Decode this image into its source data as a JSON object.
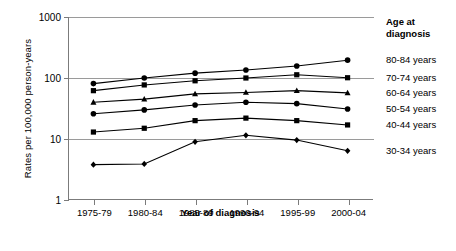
{
  "chart_data": {
    "type": "line",
    "title": "",
    "xlabel": "Year of diagnosis",
    "ylabel": "Rates per 100,000 person-years",
    "categories": [
      "1975-79",
      "1980-84",
      "1985-89",
      "1990-94",
      "1995-99",
      "2000-04"
    ],
    "yscale": "log",
    "ylim": [
      1,
      1000
    ],
    "yticks": [
      "1",
      "10",
      "100",
      "1000"
    ],
    "grid": true,
    "legend_position": "right",
    "legend_title_line1": "Age at",
    "legend_title_line2": "diagnosis",
    "series": [
      {
        "name": "80-84 years",
        "marker": "circle",
        "values": [
          81,
          100,
          120,
          135,
          157,
          196
        ]
      },
      {
        "name": "70-74 years",
        "marker": "square",
        "values": [
          62,
          77,
          90,
          100,
          113,
          101
        ]
      },
      {
        "name": "60-64 years",
        "marker": "triangle",
        "values": [
          40,
          45,
          55,
          58,
          62,
          57
        ]
      },
      {
        "name": "50-54 years",
        "marker": "circle",
        "values": [
          26,
          30,
          36,
          40,
          38,
          31
        ]
      },
      {
        "name": "40-44 years",
        "marker": "square",
        "values": [
          13,
          15,
          20,
          22,
          20,
          17
        ]
      },
      {
        "name": "30-34 years",
        "marker": "diamond",
        "values": [
          3.8,
          3.9,
          9.0,
          11.5,
          9.6,
          6.4
        ]
      }
    ]
  }
}
